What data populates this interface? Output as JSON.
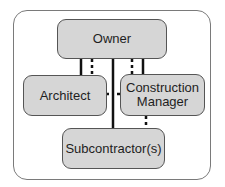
{
  "diagram": {
    "type": "organizational-relationship",
    "nodes": [
      {
        "id": "owner",
        "label": "Owner"
      },
      {
        "id": "architect",
        "label": "Architect"
      },
      {
        "id": "construction_manager",
        "label": "Construction\nManager",
        "lines": [
          "Construction",
          "Manager"
        ]
      },
      {
        "id": "subcontractors",
        "label": "Subcontractor(s)"
      }
    ],
    "edges": [
      {
        "from": "owner",
        "to": "architect",
        "style": "solid",
        "meaning": "contractual"
      },
      {
        "from": "owner",
        "to": "architect",
        "style": "dotted",
        "meaning": "communication"
      },
      {
        "from": "owner",
        "to": "construction_manager",
        "style": "solid",
        "meaning": "contractual"
      },
      {
        "from": "owner",
        "to": "construction_manager",
        "style": "dotted",
        "meaning": "communication"
      },
      {
        "from": "owner",
        "to": "subcontractors",
        "style": "solid",
        "meaning": "contractual"
      },
      {
        "from": "architect",
        "to": "construction_manager",
        "style": "dotted",
        "meaning": "communication"
      },
      {
        "from": "construction_manager",
        "to": "subcontractors",
        "style": "dotted",
        "meaning": "communication"
      }
    ],
    "colors": {
      "node_fill": "#d6d6d6",
      "node_border": "#555555",
      "line": "#111111",
      "frame_border": "#7a7a7a"
    }
  }
}
